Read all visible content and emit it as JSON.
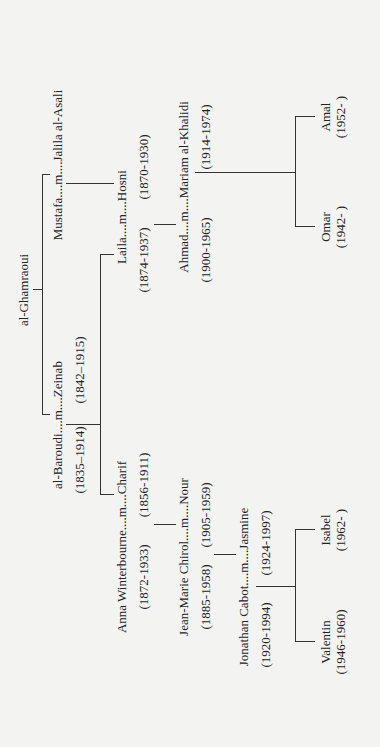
{
  "title": "al-Ghamraoui",
  "root": {
    "name": "al-Ghamraoui"
  },
  "couples": [
    {
      "id": "baroudi-zeinab",
      "label": "al-Baroudi....m....Zeinab",
      "dates_left": "(1835–1914)",
      "dates_right": "(1842–1915)"
    },
    {
      "id": "mustafa-jalila",
      "label": "Mustafa....m....Jalila al-Asali",
      "dates_left": "",
      "dates_right": ""
    },
    {
      "id": "anna-charif",
      "label": "Anna Winterbourne....m....Charif",
      "dates_left": "(1872-1933)",
      "dates_right": "(1856-1911)"
    },
    {
      "id": "laila-hosni",
      "label": "Laila....m....Hosni",
      "dates_left": "(1874-1937)",
      "dates_right": "(1870-1930)"
    },
    {
      "id": "jeanmarie-nour",
      "label": "Jean-Marie Chirol....m....Nour",
      "dates_left": "(1885-1958)",
      "dates_right": "(1905-1959)"
    },
    {
      "id": "ahmad-mariam",
      "label": "Ahmad....m....Mariam al-Khalidi",
      "dates_left": "(1900-1965)",
      "dates_right": "(1914-1974)"
    },
    {
      "id": "jonathan-jasmine",
      "label": "Jonathan Cabot....m....Jasmine",
      "dates_left": "(1920-1994)",
      "dates_right": "(1924-1997)"
    }
  ],
  "people": {
    "valentin": {
      "name": "Valentin",
      "dates": "(1946-1960)"
    },
    "isabel": {
      "name": "Isabel",
      "dates": "(1962- )"
    },
    "omar": {
      "name": "Omar",
      "dates": "(1942- )"
    },
    "amal": {
      "name": "Amal",
      "dates": "(1952- )"
    }
  },
  "labels": {
    "root": "al-Ghamraoui",
    "baroudi_zeinab": "al-Baroudi....m....Zeinab",
    "baroudi_dates": "(1835–1914)",
    "zeinab_dates": "(1842–1915)",
    "mustafa_jalila": "Mustafa....m....Jalila al-Asali",
    "anna_charif": "Anna Winterbourne....m....Charif",
    "anna_dates": "(1872-1933)",
    "charif_dates": "(1856-1911)",
    "laila_hosni": "Laila....m....Hosni",
    "laila_dates": "(1874-1937)",
    "hosni_dates": "(1870-1930)",
    "jeanmarie_nour": "Jean-Marie Chirol....m....Nour",
    "jeanmarie_dates": "(1885-1958)",
    "nour_dates": "(1905-1959)",
    "ahmad_mariam": "Ahmad....m....Mariam al-Khalidi",
    "ahmad_dates": "(1900-1965)",
    "mariam_dates": "(1914-1974)",
    "jonathan_jasmine": "Jonathan Cabot....m....Jasmine",
    "jonathan_dates": "(1920-1994)",
    "jasmine_dates": "(1924-1997)",
    "valentin": "Valentin",
    "valentin_dates": "(1946-1960)",
    "isabel": "Isabel",
    "isabel_dates": "(1962- )",
    "omar": "Omar",
    "omar_dates": "(1942- )",
    "amal": "Amal",
    "amal_dates": "(1952- )"
  },
  "colors": {
    "background": "#f3f3f1",
    "ink": "#222222",
    "line": "#333333"
  }
}
